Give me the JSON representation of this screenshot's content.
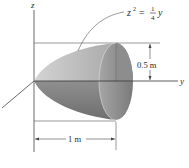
{
  "figure": {
    "axes": {
      "z_label": "z",
      "y_label": "y"
    },
    "equation": {
      "lhs_var": "z",
      "lhs_exp": "2",
      "equals": "=",
      "frac_num": "1",
      "frac_den": "4",
      "rhs_var": "y"
    },
    "dimensions": {
      "radius_label": "0.5 m",
      "length_label": "1 m"
    },
    "colors": {
      "upper_surface": "#bdbdbd",
      "lower_surface": "#8a8a8a",
      "end_face_light": "#a8a8a8",
      "end_face_dark": "#7c7c7c",
      "line": "#333333"
    }
  }
}
